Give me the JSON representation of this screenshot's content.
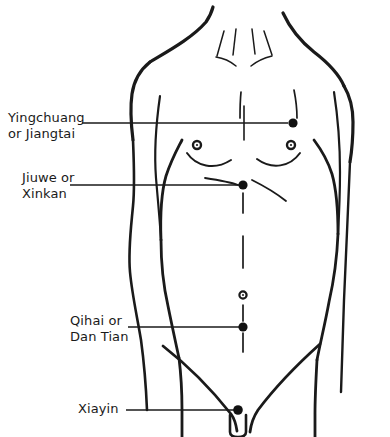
{
  "figure": {
    "background_color": "#ffffff",
    "line_color": "#1a1a1a",
    "point_color": "#111111"
  },
  "labels": [
    {
      "id": "yingchuang",
      "line1": "Yingchuang",
      "line2": "or Jiangtai",
      "text_x": 8,
      "text_y": 110,
      "align": "left",
      "leader_x1": 82,
      "leader_y1": 123,
      "leader_x2": 288,
      "leader_y2": 123
    },
    {
      "id": "jiuwe",
      "line1": "Jiuwe or",
      "line2": "Xinkan",
      "text_x": 22,
      "text_y": 170,
      "align": "left",
      "leader_x1": 70,
      "leader_y1": 185,
      "leader_x2": 239,
      "leader_y2": 185
    },
    {
      "id": "qihai",
      "line1": "Qihai or",
      "line2": "Dan Tian",
      "text_x": 70,
      "text_y": 313,
      "align": "left",
      "leader_x1": 128,
      "leader_y1": 327,
      "leader_x2": 239,
      "leader_y2": 327
    },
    {
      "id": "xiayin",
      "line1": "Xiayin",
      "line2": "",
      "text_x": 78,
      "text_y": 401,
      "align": "left",
      "leader_x1": 126,
      "leader_y1": 410,
      "leader_x2": 234,
      "leader_y2": 410
    }
  ],
  "points": [
    {
      "id": "yingchuang-point",
      "name": "Yingchuang or Jiangtai",
      "x": 293,
      "y": 123,
      "r": 4.6,
      "style": "solid"
    },
    {
      "id": "jiuwe-point",
      "name": "Jiuwe or Xinkan",
      "x": 243,
      "y": 185,
      "r": 4.6,
      "style": "solid"
    },
    {
      "id": "qihai-point",
      "name": "Qihai or Dan Tian",
      "x": 243,
      "y": 327,
      "r": 4.6,
      "style": "solid"
    },
    {
      "id": "xiayin-point",
      "name": "Xiayin",
      "x": 238,
      "y": 410,
      "r": 4.8,
      "style": "solid"
    }
  ],
  "anatomy_marks": [
    {
      "id": "left-nipple",
      "name": "left nipple",
      "x": 197,
      "y": 145,
      "r": 4.0,
      "style": "ring"
    },
    {
      "id": "right-nipple",
      "name": "right nipple",
      "x": 291,
      "y": 145,
      "r": 4.0,
      "style": "ring"
    },
    {
      "id": "navel",
      "name": "navel",
      "x": 243,
      "y": 295,
      "r": 3.6,
      "style": "ring"
    }
  ]
}
